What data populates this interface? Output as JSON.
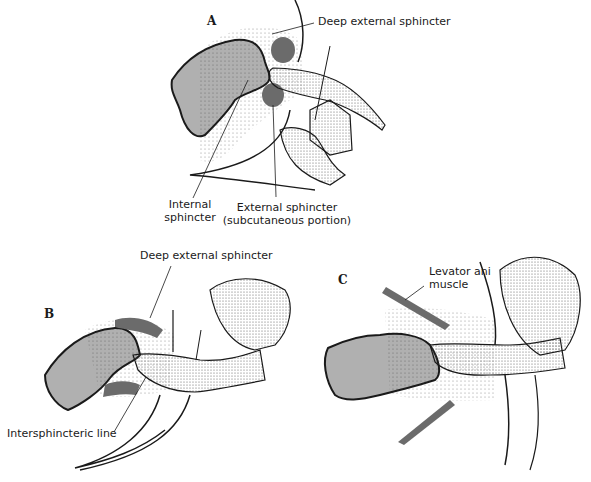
{
  "figure": {
    "panels": [
      {
        "id": "A",
        "letter": "A",
        "labels": {
          "deep_external": "Deep external sphincter",
          "internal_line1": "Internal",
          "internal_line2": "sphincter",
          "external_line1": "External sphincter",
          "external_line2": "(subcutaneous portion)"
        }
      },
      {
        "id": "B",
        "letter": "B",
        "labels": {
          "deep_external": "Deep external sphincter",
          "intersphincteric": "Intersphincteric line"
        }
      },
      {
        "id": "C",
        "letter": "C",
        "labels": {
          "levator_line1": "Levator ani",
          "levator_line2": "muscle"
        }
      }
    ],
    "colors": {
      "ink": "#1a1a1a",
      "muscle_fill": "#6b6b6b",
      "stipple_light": "#cfcfcf",
      "stipple_dark": "#3a3a3a"
    }
  }
}
